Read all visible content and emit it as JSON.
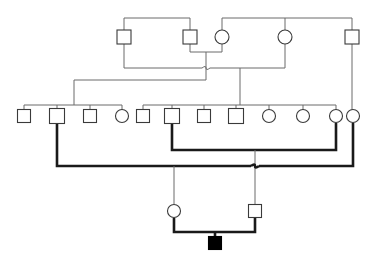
{
  "diagram": {
    "type": "pedigree",
    "width": 374,
    "height": 265,
    "background_color": "#ffffff",
    "thin_line_color": "#6b6b6b",
    "thick_line_color": "#1a1a1a",
    "symbol_stroke_color": "#3a3a3a",
    "symbol_fill_unaffected": "#ffffff",
    "symbol_fill_affected": "#000000",
    "generations": [
      {
        "id": "generation-1",
        "label": "I",
        "y": 37,
        "members": [
          {
            "id": "I-1",
            "sex": "male",
            "shape": "square",
            "affected": false,
            "x": 124,
            "y": 37,
            "size": 14
          },
          {
            "id": "I-2",
            "sex": "male",
            "shape": "square",
            "affected": false,
            "x": 190,
            "y": 37,
            "size": 14
          },
          {
            "id": "I-3",
            "sex": "female",
            "shape": "circle",
            "affected": false,
            "x": 222,
            "y": 37,
            "size": 14
          },
          {
            "id": "I-4",
            "sex": "female",
            "shape": "circle",
            "affected": false,
            "x": 285,
            "y": 37,
            "size": 14
          },
          {
            "id": "I-5",
            "sex": "male",
            "shape": "square",
            "affected": false,
            "x": 352,
            "y": 37,
            "size": 14
          }
        ]
      },
      {
        "id": "generation-2",
        "label": "II",
        "y": 116,
        "members": [
          {
            "id": "II-1",
            "sex": "male",
            "shape": "square",
            "affected": false,
            "x": 24,
            "y": 116,
            "size": 13
          },
          {
            "id": "II-2",
            "sex": "male",
            "shape": "square",
            "affected": false,
            "x": 57,
            "y": 116,
            "size": 15
          },
          {
            "id": "II-3",
            "sex": "male",
            "shape": "square",
            "affected": false,
            "x": 90,
            "y": 116,
            "size": 13
          },
          {
            "id": "II-4",
            "sex": "female",
            "shape": "circle",
            "affected": false,
            "x": 122,
            "y": 116,
            "size": 13
          },
          {
            "id": "II-5",
            "sex": "male",
            "shape": "square",
            "affected": false,
            "x": 143,
            "y": 116,
            "size": 13
          },
          {
            "id": "II-6",
            "sex": "male",
            "shape": "square",
            "affected": false,
            "x": 172,
            "y": 116,
            "size": 15
          },
          {
            "id": "II-7",
            "sex": "male",
            "shape": "square",
            "affected": false,
            "x": 204,
            "y": 116,
            "size": 13
          },
          {
            "id": "II-8",
            "sex": "male",
            "shape": "square",
            "affected": false,
            "x": 236,
            "y": 116,
            "size": 15
          },
          {
            "id": "II-9",
            "sex": "female",
            "shape": "circle",
            "affected": false,
            "x": 269,
            "y": 116,
            "size": 13
          },
          {
            "id": "II-10",
            "sex": "female",
            "shape": "circle",
            "affected": false,
            "x": 303,
            "y": 116,
            "size": 13
          },
          {
            "id": "II-11",
            "sex": "female",
            "shape": "circle",
            "affected": false,
            "x": 336,
            "y": 116,
            "size": 13
          },
          {
            "id": "II-12",
            "sex": "female",
            "shape": "circle",
            "affected": false,
            "x": 353,
            "y": 116,
            "size": 13
          }
        ]
      },
      {
        "id": "generation-3",
        "label": "III",
        "y": 211,
        "members": [
          {
            "id": "III-1",
            "sex": "female",
            "shape": "circle",
            "affected": false,
            "x": 174,
            "y": 211,
            "size": 13
          },
          {
            "id": "III-2",
            "sex": "male",
            "shape": "square",
            "affected": false,
            "x": 255,
            "y": 211,
            "size": 13
          }
        ]
      },
      {
        "id": "generation-4",
        "label": "IV",
        "y": 243,
        "members": [
          {
            "id": "IV-1",
            "sex": "male",
            "shape": "square",
            "affected": true,
            "x": 215,
            "y": 243,
            "size": 13
          }
        ]
      }
    ],
    "counts": {
      "total_individuals": 20,
      "males": 11,
      "females": 9,
      "affected": 1,
      "proband_id": "IV-1"
    },
    "matings": [
      {
        "id": "mating-I2-I3",
        "partners": [
          "I-2",
          "I-3"
        ],
        "line_y": 52,
        "descent_x": 206,
        "weight": "thin"
      },
      {
        "id": "mating-I1-I3",
        "partners": [
          "I-1",
          "I-3"
        ],
        "line_y": 68,
        "descent_x": 74,
        "weight": "thin"
      },
      {
        "id": "mating-I4-I3",
        "partners": [
          "I-3",
          "I-4"
        ],
        "line_y": 68,
        "descent_x": 240,
        "weight": "thin"
      },
      {
        "id": "mating-II6-II11",
        "partners": [
          "II-6",
          "II-11"
        ],
        "line_y": 150,
        "descent_x": 255,
        "weight": "thick"
      },
      {
        "id": "mating-II2-II12",
        "partners": [
          "II-2",
          "II-12"
        ],
        "line_y": 166,
        "descent_x": 174,
        "weight": "thick"
      },
      {
        "id": "mating-III1-III2",
        "partners": [
          "III-1",
          "III-2"
        ],
        "line_y": 232,
        "descent_x": 215,
        "weight": "thick"
      }
    ],
    "sibships": [
      {
        "id": "sibship-top-left",
        "bar_y": 18,
        "from_x": 124,
        "to_x": 190,
        "children": [
          "I-1",
          "I-2"
        ]
      },
      {
        "id": "sibship-top-right",
        "bar_y": 18,
        "from_x": 222,
        "to_x": 352,
        "children": [
          "I-3",
          "I-4",
          "I-5"
        ]
      },
      {
        "id": "sibship-gen2-left",
        "bar_y": 105,
        "from_x": 24,
        "to_x": 122,
        "children": [
          "II-1",
          "II-2",
          "II-3",
          "II-4"
        ]
      },
      {
        "id": "sibship-gen2-right",
        "bar_y": 105,
        "from_x": 143,
        "to_x": 336,
        "children": [
          "II-5",
          "II-6",
          "II-7",
          "II-8",
          "II-9",
          "II-10",
          "II-11"
        ]
      }
    ],
    "legend": {
      "square_means": "male",
      "circle_means": "female",
      "filled_means": "affected",
      "open_means": "unaffected"
    }
  }
}
